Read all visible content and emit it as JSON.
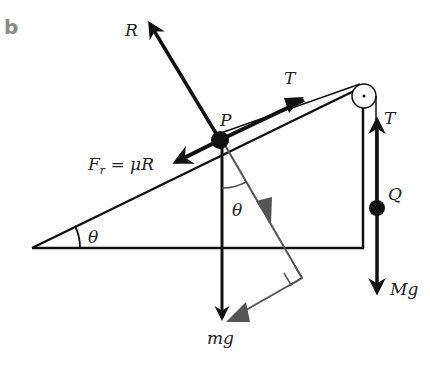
{
  "panel_label": "b",
  "labels": {
    "reaction": "R",
    "tension_incline": "T",
    "tension_vertical": "T",
    "particle_p": "P",
    "particle_q": "Q",
    "friction": "F",
    "friction_sub": "r",
    "friction_eq": " = μR",
    "weight_p": "mg",
    "weight_q": "Mg",
    "angle_incline": "θ",
    "angle_weight": "θ"
  },
  "colors": {
    "line": "#111111",
    "component": "#555555",
    "panel": "#8a8a8a"
  }
}
